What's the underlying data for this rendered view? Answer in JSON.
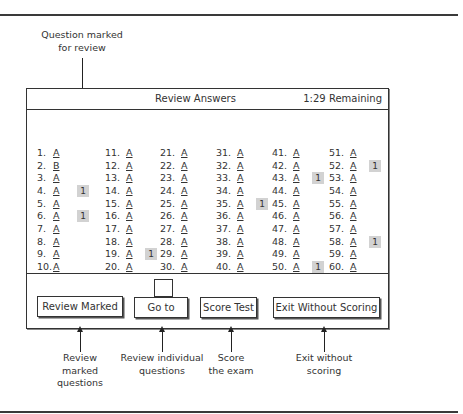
{
  "callouts": {
    "marked_for_review": [
      "Question marked",
      "for review"
    ],
    "review_marked": [
      "Review",
      "marked",
      "questions"
    ],
    "go_to": [
      "Review individual",
      "questions"
    ],
    "score_test": [
      "Score",
      "the exam"
    ],
    "exit": [
      "Exit without",
      "scoring"
    ]
  },
  "window": {
    "title": "Review Answers",
    "time_remaining": "1:29 Remaining"
  },
  "answers": {
    "columns": [
      [
        {
          "num": "1.",
          "ans": "A",
          "mark": null
        },
        {
          "num": "2.",
          "ans": "B",
          "mark": null
        },
        {
          "num": "3.",
          "ans": "A",
          "mark": null
        },
        {
          "num": "4.",
          "ans": "A",
          "mark": "1"
        },
        {
          "num": "5.",
          "ans": "A",
          "mark": null
        },
        {
          "num": "6.",
          "ans": "A",
          "mark": "1"
        },
        {
          "num": "7.",
          "ans": "A",
          "mark": null
        },
        {
          "num": "8.",
          "ans": "A",
          "mark": null
        },
        {
          "num": "9.",
          "ans": "A",
          "mark": null
        },
        {
          "num": "10.",
          "ans": "A",
          "mark": null
        }
      ],
      [
        {
          "num": "11.",
          "ans": "A",
          "mark": null
        },
        {
          "num": "12.",
          "ans": "A",
          "mark": null
        },
        {
          "num": "13.",
          "ans": "A",
          "mark": null
        },
        {
          "num": "14.",
          "ans": "A",
          "mark": null
        },
        {
          "num": "15.",
          "ans": "A",
          "mark": null
        },
        {
          "num": "16.",
          "ans": "A",
          "mark": null
        },
        {
          "num": "17.",
          "ans": "A",
          "mark": null
        },
        {
          "num": "18.",
          "ans": "A",
          "mark": null
        },
        {
          "num": "19.",
          "ans": "A",
          "mark": "1"
        },
        {
          "num": "20.",
          "ans": "A",
          "mark": null
        }
      ],
      [
        {
          "num": "21.",
          "ans": "A",
          "mark": null
        },
        {
          "num": "22.",
          "ans": "A",
          "mark": null
        },
        {
          "num": "23.",
          "ans": "A",
          "mark": null
        },
        {
          "num": "24.",
          "ans": "A",
          "mark": null
        },
        {
          "num": "25.",
          "ans": "A",
          "mark": null
        },
        {
          "num": "26.",
          "ans": "A",
          "mark": null
        },
        {
          "num": "27.",
          "ans": "A",
          "mark": null
        },
        {
          "num": "28.",
          "ans": "A",
          "mark": null
        },
        {
          "num": "29.",
          "ans": "A",
          "mark": null
        },
        {
          "num": "30.",
          "ans": "A",
          "mark": null
        }
      ],
      [
        {
          "num": "31.",
          "ans": "A",
          "mark": null
        },
        {
          "num": "32.",
          "ans": "A",
          "mark": null
        },
        {
          "num": "33.",
          "ans": "A",
          "mark": null
        },
        {
          "num": "34.",
          "ans": "A",
          "mark": null
        },
        {
          "num": "35.",
          "ans": "A",
          "mark": "1"
        },
        {
          "num": "36.",
          "ans": "A",
          "mark": null
        },
        {
          "num": "37.",
          "ans": "A",
          "mark": null
        },
        {
          "num": "38.",
          "ans": "A",
          "mark": null
        },
        {
          "num": "39.",
          "ans": "A",
          "mark": null
        },
        {
          "num": "40.",
          "ans": "A",
          "mark": null
        }
      ],
      [
        {
          "num": "41.",
          "ans": "A",
          "mark": null
        },
        {
          "num": "42.",
          "ans": "A",
          "mark": null
        },
        {
          "num": "43.",
          "ans": "A",
          "mark": "1"
        },
        {
          "num": "44.",
          "ans": "A",
          "mark": null
        },
        {
          "num": "45.",
          "ans": "A",
          "mark": null
        },
        {
          "num": "46.",
          "ans": "A",
          "mark": null
        },
        {
          "num": "47.",
          "ans": "A",
          "mark": null
        },
        {
          "num": "48.",
          "ans": "A",
          "mark": null
        },
        {
          "num": "49.",
          "ans": "A",
          "mark": null
        },
        {
          "num": "50.",
          "ans": "A",
          "mark": "1"
        }
      ],
      [
        {
          "num": "51.",
          "ans": "A",
          "mark": null
        },
        {
          "num": "52.",
          "ans": "A",
          "mark": "1"
        },
        {
          "num": "53.",
          "ans": "A",
          "mark": null
        },
        {
          "num": "54.",
          "ans": "A",
          "mark": null
        },
        {
          "num": "55.",
          "ans": "A",
          "mark": null
        },
        {
          "num": "56.",
          "ans": "A",
          "mark": null
        },
        {
          "num": "57.",
          "ans": "A",
          "mark": null
        },
        {
          "num": "58.",
          "ans": "A",
          "mark": "1"
        },
        {
          "num": "59.",
          "ans": "A",
          "mark": null
        },
        {
          "num": "60.",
          "ans": "A",
          "mark": null
        }
      ]
    ]
  },
  "buttons": {
    "review_marked": "Review Marked",
    "go_to": "Go to",
    "score_test": "Score Test",
    "exit_without_scoring": "Exit Without Scoring"
  },
  "goto_input": {
    "value": ""
  },
  "colors": {
    "badge": "#d2d2d2",
    "border": "#333333"
  }
}
